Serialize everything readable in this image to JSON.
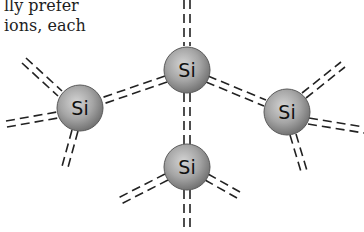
{
  "text": {
    "line1": "lly prefer",
    "line2": "ions, each"
  },
  "diagram": {
    "atom_fill_light": "#c9c9c9",
    "atom_fill_dark": "#7a7a7a",
    "atom_stroke": "#555555",
    "bond_color": "#222222",
    "atoms": [
      {
        "id": "top",
        "label": "Si",
        "x": 187,
        "y": 70
      },
      {
        "id": "left",
        "label": "Si",
        "x": 80,
        "y": 108
      },
      {
        "id": "right",
        "label": "Si",
        "x": 287,
        "y": 112
      },
      {
        "id": "bottom",
        "label": "Si",
        "x": 187,
        "y": 167
      }
    ]
  }
}
